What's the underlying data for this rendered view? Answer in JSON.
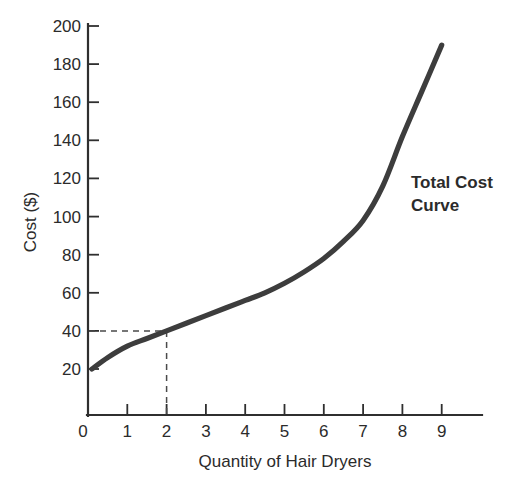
{
  "chart_data": {
    "type": "line",
    "title": "",
    "annotation": "Total Cost Curve",
    "annotation_line1": "Total Cost",
    "annotation_line2": "Curve",
    "xlabel": "Quantity of Hair Dryers",
    "ylabel": "Cost ($)",
    "xlim": [
      0,
      10.0
    ],
    "ylim": [
      0,
      200
    ],
    "xticks": [
      0,
      1,
      2,
      3,
      4,
      5,
      6,
      7,
      8,
      9
    ],
    "xtick_labels": [
      "0",
      "1",
      "2",
      "3",
      "4",
      "5",
      "6",
      "7",
      "8",
      "9"
    ],
    "yticks": [
      20,
      40,
      60,
      80,
      100,
      120,
      140,
      160,
      180,
      200
    ],
    "ytick_labels": [
      "20",
      "40",
      "60",
      "80",
      "100",
      "120",
      "140",
      "160",
      "180",
      "200"
    ],
    "grid": false,
    "legend": null,
    "series": [
      {
        "name": "Total Cost Curve",
        "color": "#3d3d3d",
        "x": [
          0.1,
          0.5,
          1.0,
          1.5,
          2.0,
          2.5,
          3.0,
          3.5,
          4.0,
          4.5,
          5.0,
          5.5,
          6.0,
          6.5,
          7.0,
          7.5,
          8.0,
          8.5,
          9.0
        ],
        "values": [
          20,
          26,
          32,
          36,
          40,
          44,
          48,
          52,
          56,
          60,
          65,
          71,
          78,
          87,
          98,
          116,
          142,
          166,
          190
        ]
      }
    ],
    "guides": [
      {
        "name": "cost-40-guide",
        "type": "horizontal",
        "value": 40,
        "from_x": 0,
        "to_x": 2
      },
      {
        "name": "quantity-2-guide",
        "type": "vertical",
        "value": 2,
        "from_y": 0,
        "to_y": 40
      }
    ],
    "marked_point": {
      "x": 2,
      "y": 40
    }
  },
  "figure": {
    "background": "#ffffff",
    "axis_color": "#2f2f2f",
    "curve_color": "#3d3d3d",
    "text_color": "#2b2b2b"
  }
}
